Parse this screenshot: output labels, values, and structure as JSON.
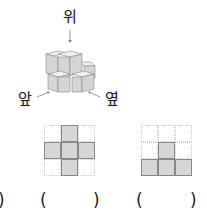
{
  "figure": {
    "labels": {
      "top": "위",
      "front": "앞",
      "side": "옆"
    },
    "cube_structure": "stacked-unit-cubes"
  },
  "views": [
    {
      "name": "view-1",
      "grid": [
        [
          0,
          1,
          0
        ],
        [
          1,
          1,
          1
        ],
        [
          0,
          1,
          0
        ]
      ],
      "open_paren": "(",
      "close_paren": ")"
    },
    {
      "name": "view-2",
      "grid": [
        [
          0,
          0,
          0
        ],
        [
          0,
          1,
          0
        ],
        [
          1,
          1,
          1
        ]
      ],
      "open_paren": "(",
      "close_paren": ")"
    }
  ],
  "leading_paren": ")",
  "colors": {
    "filled_cell": "#d6d6d6",
    "cell_border": "#888888",
    "grid_dotted": "#cccccc"
  }
}
